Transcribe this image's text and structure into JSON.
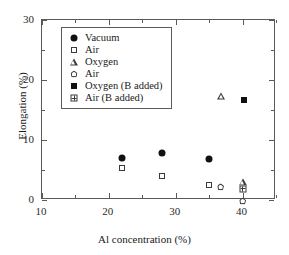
{
  "chart_data": {
    "type": "scatter",
    "title": "",
    "xlabel": "Al concentration (%)",
    "ylabel": "Elongation (%)",
    "xlim": [
      10,
      45
    ],
    "ylim": [
      0,
      30
    ],
    "xticks": [
      10,
      20,
      30,
      40
    ],
    "yticks": [
      0,
      10,
      20,
      30
    ],
    "xminor": [
      15,
      25,
      35,
      45
    ],
    "yminor": [
      5,
      15,
      25
    ],
    "grid": false,
    "legend_position": "upper-center",
    "series": [
      {
        "name": "Vacuum",
        "marker": "filled-circle",
        "color": "#111111",
        "points": [
          {
            "x": 16.0,
            "y": 26.2
          },
          {
            "x": 22.0,
            "y": 7.0
          },
          {
            "x": 28.0,
            "y": 7.8
          },
          {
            "x": 35.0,
            "y": 6.8
          }
        ]
      },
      {
        "name": "Air",
        "marker": "open-square",
        "color": "#3a3a3a",
        "points": [
          {
            "x": 16.0,
            "y": 24.8
          },
          {
            "x": 22.0,
            "y": 5.4
          },
          {
            "x": 28.0,
            "y": 4.0
          },
          {
            "x": 35.0,
            "y": 2.5
          }
        ]
      },
      {
        "name": "Oxygen",
        "marker": "open-triangle",
        "color": "#3a3a3a",
        "points": [
          {
            "x": 36.8,
            "y": 17.4
          },
          {
            "x": 40.0,
            "y": 3.0
          }
        ]
      },
      {
        "name": "Air",
        "marker": "open-pentagon",
        "color": "#3a3a3a",
        "points": [
          {
            "x": 36.7,
            "y": 2.2
          },
          {
            "x": 40.0,
            "y": 1.0
          }
        ]
      },
      {
        "name": "Oxygen (B added)",
        "marker": "filled-square",
        "color": "#111111",
        "points": [
          {
            "x": 40.2,
            "y": 16.7
          }
        ]
      },
      {
        "name": "Air (B added)",
        "marker": "grid-square",
        "color": "#3a3a3a",
        "points": [
          {
            "x": 40.0,
            "y": 4.2
          }
        ]
      }
    ]
  },
  "legend": {
    "entries": [
      {
        "label": "Vacuum",
        "marker": "filled-circle"
      },
      {
        "label": "Air",
        "marker": "open-square"
      },
      {
        "label": "Oxygen",
        "marker": "open-triangle"
      },
      {
        "label": "Air",
        "marker": "open-pentagon"
      },
      {
        "label": "Oxygen (B added)",
        "marker": "filled-square"
      },
      {
        "label": "Air (B added)",
        "marker": "grid-square"
      }
    ]
  },
  "axes": {
    "x_title": "Al concentration (%)",
    "y_title": "Elongation (%)",
    "x_tick_labels": [
      "10",
      "20",
      "30",
      "40"
    ],
    "y_tick_labels": [
      "0",
      "10",
      "20",
      "30"
    ]
  }
}
